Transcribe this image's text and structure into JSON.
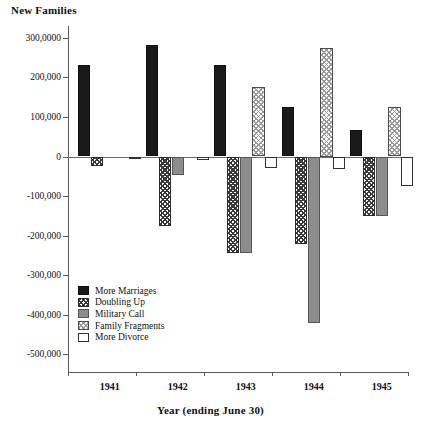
{
  "chart_data": {
    "type": "bar",
    "title": "",
    "ylabel": "New Families",
    "xlabel": "Year (ending June 30)",
    "categories": [
      "1941",
      "1942",
      "1943",
      "1944",
      "1945"
    ],
    "ylim": [
      -550000,
      330000
    ],
    "grid": false,
    "legend_position": "inside-bottom-left",
    "ytick_labels": [
      "300,0000",
      "200,000",
      "100,000",
      "0",
      "-100,000",
      "-200,000",
      "-300,000",
      "-400,000",
      "-500,000"
    ],
    "ytick_values": [
      300000,
      200000,
      100000,
      0,
      -100000,
      -200000,
      -300000,
      -400000,
      -500000
    ],
    "series": [
      {
        "name": "More Marriages",
        "pattern": "solid-black",
        "values": [
          232000,
          283000,
          232000,
          125000,
          68000
        ]
      },
      {
        "name": "Doubling Up",
        "pattern": "dark-checker",
        "values": [
          -25000,
          -175000,
          -245000,
          -222000,
          -150000
        ]
      },
      {
        "name": "Military  Call",
        "pattern": "solid-gray",
        "values": [
          0,
          -48000,
          -245000,
          -420000,
          -150000
        ]
      },
      {
        "name": "Family Fragments",
        "pattern": "light-checker",
        "values": [
          0,
          0,
          175000,
          275000,
          125000
        ]
      },
      {
        "name": "More Divorce",
        "pattern": "white",
        "values": [
          -6000,
          -8000,
          -30000,
          -32000,
          -75000
        ]
      }
    ]
  }
}
